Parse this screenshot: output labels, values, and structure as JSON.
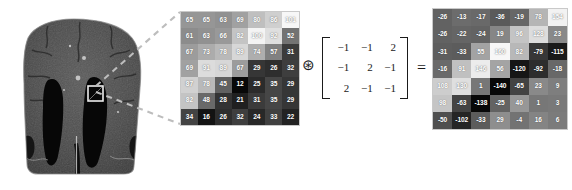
{
  "figure": {
    "operator_conv": "⊛",
    "operator_equals": "=",
    "bracket_left": "",
    "bracket_right": ""
  },
  "mri": {
    "label": "coronal-brain-mri",
    "modality": "MRI",
    "view": "coronal",
    "roi_box_label": "region-of-interest",
    "background_color": "#ffffff",
    "tissue_color": "#4a4a4a",
    "ventricle_color": "#070707",
    "roi_outline_color": "#e8e8e8"
  },
  "callout": {
    "line_color": "#b9b9b9",
    "style": "dashed"
  },
  "chart_data": {
    "type": "heatmap",
    "source_matrix": {
      "label": "image-patch",
      "rows": 7,
      "cols": 7,
      "vmin": 12,
      "vmax": 101,
      "colormap": "gray",
      "values": [
        [
          65,
          65,
          63,
          69,
          80,
          86,
          101
        ],
        [
          61,
          63,
          66,
          82,
          100,
          92,
          52
        ],
        [
          67,
          73,
          78,
          89,
          74,
          57,
          31
        ],
        [
          69,
          91,
          89,
          67,
          29,
          26,
          32
        ],
        [
          87,
          78,
          45,
          12,
          25,
          35,
          29
        ],
        [
          82,
          48,
          28,
          21,
          31,
          35,
          29
        ],
        [
          34,
          16,
          26,
          32,
          24,
          33,
          22
        ]
      ]
    },
    "kernel": {
      "label": "edge-detection-kernel",
      "rows": 3,
      "cols": 3,
      "values": [
        [
          "−1",
          "−1",
          "2"
        ],
        [
          "−1",
          "2",
          "−1"
        ],
        [
          "2",
          "−1",
          "−1"
        ]
      ]
    },
    "result_matrix": {
      "label": "convolution-output",
      "rows": 7,
      "cols": 7,
      "vmin": -138,
      "vmax": 160,
      "colormap": "gray",
      "values": [
        [
          -26,
          -13,
          -17,
          -36,
          -19,
          78,
          154
        ],
        [
          -26,
          -22,
          -24,
          19,
          96,
          128,
          23
        ],
        [
          -31,
          -33,
          55,
          160,
          82,
          -79,
          -115
        ],
        [
          -16,
          91,
          146,
          56,
          -120,
          -92,
          -18
        ],
        [
          108,
          130,
          1,
          -140,
          -65,
          23,
          9
        ],
        [
          98,
          -63,
          -138,
          -25,
          40,
          1,
          3
        ],
        [
          -50,
          -102,
          -33,
          29,
          -4,
          16,
          6
        ]
      ]
    }
  }
}
